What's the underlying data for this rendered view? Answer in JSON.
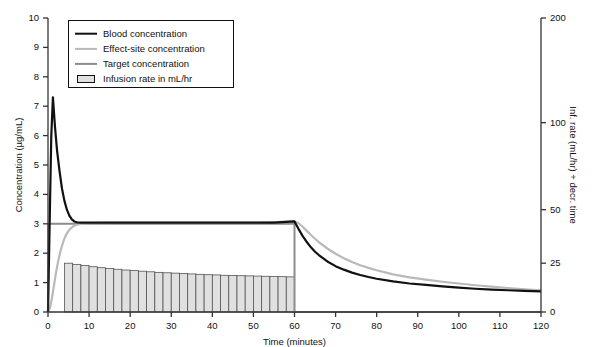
{
  "chart_data": {
    "type": "line",
    "title": "",
    "xlabel": "Time (minutes)",
    "ylabel": "Concentration (µg/mL)",
    "y2label": "Inf. rate (mL/hr) + decr. time",
    "xlim": [
      0,
      120
    ],
    "ylim": [
      0,
      10
    ],
    "y2lim": [
      0,
      200
    ],
    "xticks": [
      0,
      10,
      20,
      30,
      40,
      50,
      60,
      70,
      80,
      90,
      100,
      110,
      120
    ],
    "yticks": [
      0,
      1,
      2,
      3,
      4,
      5,
      6,
      7,
      8,
      9,
      10
    ],
    "y2ticks": [
      0,
      25,
      50,
      100,
      200
    ],
    "y2_scale": "nonlinear",
    "y2_tick_positions_frac": [
      0.0,
      0.166,
      0.348,
      0.644,
      1.0
    ],
    "grid": false,
    "legend_position": "top-left",
    "colors": {
      "blood": "#111111",
      "effect_site": "#b9b9b9",
      "target": "#8c8c8c",
      "infusion_fill": "#e0e0e0",
      "infusion_edge": "#555555",
      "axis": "#333333"
    },
    "series": [
      {
        "name": "Blood concentration",
        "color": "#111111",
        "width": 2.2,
        "points": [
          [
            0,
            0
          ],
          [
            0.4,
            3.0
          ],
          [
            0.8,
            6.0
          ],
          [
            1.2,
            7.3
          ],
          [
            1.7,
            6.3
          ],
          [
            2.2,
            5.5
          ],
          [
            2.8,
            4.8
          ],
          [
            3.4,
            4.2
          ],
          [
            4.0,
            3.78
          ],
          [
            4.6,
            3.48
          ],
          [
            5.2,
            3.28
          ],
          [
            5.8,
            3.15
          ],
          [
            6.4,
            3.08
          ],
          [
            7.0,
            3.05
          ],
          [
            8.0,
            3.04
          ],
          [
            10,
            3.04
          ],
          [
            15,
            3.04
          ],
          [
            20,
            3.04
          ],
          [
            25,
            3.04
          ],
          [
            30,
            3.04
          ],
          [
            35,
            3.04
          ],
          [
            40,
            3.04
          ],
          [
            45,
            3.04
          ],
          [
            50,
            3.04
          ],
          [
            55,
            3.04
          ],
          [
            60,
            3.08
          ],
          [
            61,
            2.82
          ],
          [
            62,
            2.58
          ],
          [
            63,
            2.38
          ],
          [
            64,
            2.2
          ],
          [
            65,
            2.05
          ],
          [
            66,
            1.93
          ],
          [
            68,
            1.72
          ],
          [
            70,
            1.56
          ],
          [
            72,
            1.44
          ],
          [
            74,
            1.34
          ],
          [
            76,
            1.26
          ],
          [
            78,
            1.19
          ],
          [
            80,
            1.13
          ],
          [
            84,
            1.04
          ],
          [
            88,
            0.97
          ],
          [
            92,
            0.92
          ],
          [
            96,
            0.87
          ],
          [
            100,
            0.83
          ],
          [
            104,
            0.79
          ],
          [
            108,
            0.76
          ],
          [
            112,
            0.74
          ],
          [
            116,
            0.72
          ],
          [
            120,
            0.7
          ]
        ]
      },
      {
        "name": "Effect-site concentration",
        "color": "#b9b9b9",
        "width": 2.2,
        "points": [
          [
            0,
            0
          ],
          [
            0.5,
            0.15
          ],
          [
            1.0,
            0.5
          ],
          [
            1.5,
            0.95
          ],
          [
            2.0,
            1.38
          ],
          [
            2.5,
            1.74
          ],
          [
            3.0,
            2.05
          ],
          [
            3.5,
            2.3
          ],
          [
            4.0,
            2.5
          ],
          [
            4.5,
            2.65
          ],
          [
            5.0,
            2.76
          ],
          [
            5.5,
            2.84
          ],
          [
            6.0,
            2.9
          ],
          [
            6.5,
            2.94
          ],
          [
            7.0,
            2.97
          ],
          [
            8.0,
            3.0
          ],
          [
            9.0,
            3.01
          ],
          [
            10,
            3.02
          ],
          [
            15,
            3.03
          ],
          [
            20,
            3.03
          ],
          [
            30,
            3.03
          ],
          [
            40,
            3.03
          ],
          [
            50,
            3.03
          ],
          [
            60,
            3.08
          ],
          [
            61,
            3.02
          ],
          [
            62,
            2.9
          ],
          [
            63,
            2.76
          ],
          [
            64,
            2.62
          ],
          [
            65,
            2.49
          ],
          [
            66,
            2.37
          ],
          [
            68,
            2.16
          ],
          [
            70,
            1.98
          ],
          [
            72,
            1.83
          ],
          [
            74,
            1.7
          ],
          [
            76,
            1.59
          ],
          [
            78,
            1.5
          ],
          [
            80,
            1.42
          ],
          [
            84,
            1.28
          ],
          [
            88,
            1.18
          ],
          [
            92,
            1.1
          ],
          [
            96,
            1.03
          ],
          [
            100,
            0.97
          ],
          [
            104,
            0.91
          ],
          [
            108,
            0.86
          ],
          [
            112,
            0.81
          ],
          [
            116,
            0.77
          ],
          [
            120,
            0.74
          ]
        ]
      },
      {
        "name": "Target concentration",
        "color": "#8c8c8c",
        "width": 2.0,
        "points": [
          [
            0,
            0
          ],
          [
            0.15,
            3.0
          ],
          [
            6,
            3.0
          ],
          [
            20,
            3.0
          ],
          [
            40,
            3.0
          ],
          [
            60,
            3.0
          ],
          [
            60.01,
            0
          ],
          [
            120,
            0
          ]
        ]
      }
    ],
    "infusion_bars": {
      "name": "Infusion rate in mL/hr",
      "axis": "right",
      "unit": "mL/hr",
      "bar_width_min": 2,
      "bars": [
        {
          "t": 5,
          "rate": 25.0
        },
        {
          "t": 7,
          "rate": 24.4
        },
        {
          "t": 9,
          "rate": 23.8
        },
        {
          "t": 11,
          "rate": 23.2
        },
        {
          "t": 13,
          "rate": 22.7
        },
        {
          "t": 15,
          "rate": 22.3
        },
        {
          "t": 17,
          "rate": 21.9
        },
        {
          "t": 19,
          "rate": 21.5
        },
        {
          "t": 21,
          "rate": 21.2
        },
        {
          "t": 23,
          "rate": 20.9
        },
        {
          "t": 25,
          "rate": 20.6
        },
        {
          "t": 27,
          "rate": 20.3
        },
        {
          "t": 29,
          "rate": 20.1
        },
        {
          "t": 31,
          "rate": 19.9
        },
        {
          "t": 33,
          "rate": 19.7
        },
        {
          "t": 35,
          "rate": 19.5
        },
        {
          "t": 37,
          "rate": 19.3
        },
        {
          "t": 39,
          "rate": 19.1
        },
        {
          "t": 41,
          "rate": 19.0
        },
        {
          "t": 43,
          "rate": 18.8
        },
        {
          "t": 45,
          "rate": 18.7
        },
        {
          "t": 47,
          "rate": 18.6
        },
        {
          "t": 49,
          "rate": 18.5
        },
        {
          "t": 51,
          "rate": 18.4
        },
        {
          "t": 53,
          "rate": 18.3
        },
        {
          "t": 55,
          "rate": 18.2
        },
        {
          "t": 57,
          "rate": 18.1
        },
        {
          "t": 59,
          "rate": 18.0
        }
      ]
    },
    "annotations": [
      {
        "text": "infusion stops",
        "t": 60
      }
    ]
  },
  "legend": {
    "items": [
      {
        "label": "Blood concentration",
        "marker": "line",
        "color": "#111111"
      },
      {
        "label": "Effect-site concentration",
        "marker": "line",
        "color": "#b9b9b9"
      },
      {
        "label": "Target concentration",
        "marker": "line",
        "color": "#8c8c8c"
      },
      {
        "label": "Infusion rate in mL/hr",
        "marker": "box",
        "color": "#e0e0e0"
      }
    ]
  }
}
